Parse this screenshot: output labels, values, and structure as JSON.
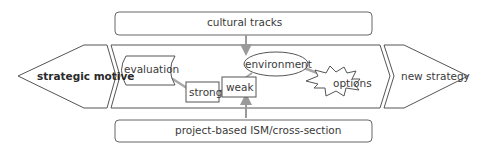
{
  "diagram": {
    "left_arrow": {
      "label": "strategic motive"
    },
    "right_arrow": {
      "label": "new strategy"
    },
    "top_box": {
      "label": "cultural tracks"
    },
    "bottom_box": {
      "label": "project-based ISM/cross-section"
    },
    "inner": {
      "evaluation": "evaluation",
      "strong": "strong",
      "weak": "weak",
      "environment": "environment",
      "options": "options"
    },
    "colors": {
      "stroke": "#555555",
      "connector": "#a8a8a8",
      "arrow": "#9a9a9a",
      "text": "#3a3a3a"
    }
  }
}
